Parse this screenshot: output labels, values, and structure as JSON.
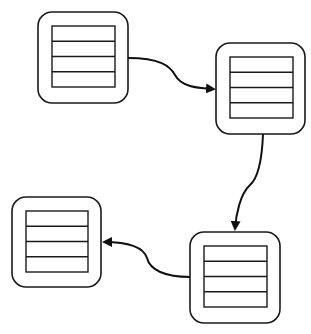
{
  "diagram": {
    "width": 311,
    "height": 334,
    "stroke_color": "#1a1a1a",
    "background": "#ffffff",
    "nodes": [
      {
        "id": "node-1",
        "x": 38,
        "y": 12,
        "w": 90,
        "h": 91,
        "inner": {
          "x": 52,
          "y": 26,
          "w": 63,
          "h": 61
        },
        "rows": 4
      },
      {
        "id": "node-2",
        "x": 216,
        "y": 43,
        "w": 89,
        "h": 91,
        "inner": {
          "x": 230,
          "y": 57,
          "w": 63,
          "h": 61
        },
        "rows": 4
      },
      {
        "id": "node-3",
        "x": 12,
        "y": 197,
        "w": 89,
        "h": 90,
        "inner": {
          "x": 26,
          "y": 211,
          "w": 62,
          "h": 61
        },
        "rows": 4
      },
      {
        "id": "node-4",
        "x": 190,
        "y": 232,
        "w": 90,
        "h": 91,
        "inner": {
          "x": 204,
          "y": 246,
          "w": 63,
          "h": 61
        },
        "rows": 4
      }
    ],
    "edges": [
      {
        "from": "node-1",
        "to": "node-2",
        "path": "M128,58 C160,58 170,66 175,75 C182,88 200,88 214,89"
      },
      {
        "from": "node-2",
        "to": "node-4",
        "path": "M263,134 C262,160 258,178 250,185 C240,194 236,215 235,229"
      },
      {
        "from": "node-4",
        "to": "node-3",
        "path": "M190,277 C165,277 150,270 147,258 C143,246 125,242 104,242"
      }
    ]
  }
}
